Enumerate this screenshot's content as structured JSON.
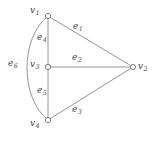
{
  "figure": {
    "type": "undirected-graph-diagram",
    "background_color": "#ffffff",
    "stroke_color": "#8a8a8a",
    "label_color": "#4a4a4a",
    "width": 155,
    "height": 142
  },
  "vertices": [
    {
      "id": "v1",
      "label": "v",
      "subscript": "1",
      "x": 48,
      "y": 16,
      "label_x": 30,
      "label_y": 6
    },
    {
      "id": "v2",
      "label": "v",
      "subscript": "2",
      "x": 133,
      "y": 67,
      "label_x": 138,
      "label_y": 62
    },
    {
      "id": "v3",
      "label": "v",
      "subscript": "3",
      "x": 48,
      "y": 67,
      "label_x": 30,
      "label_y": 60
    },
    {
      "id": "v4",
      "label": "v",
      "subscript": "4",
      "x": 48,
      "y": 120,
      "label_x": 30,
      "label_y": 119
    }
  ],
  "edges": [
    {
      "id": "e1",
      "label": "e",
      "subscript": "1",
      "from": "v1",
      "to": "v2",
      "shape": "straight",
      "label_x": 73,
      "label_y": 22
    },
    {
      "id": "e2",
      "label": "e",
      "subscript": "2",
      "from": "v3",
      "to": "v2",
      "shape": "straight",
      "label_x": 72,
      "label_y": 53
    },
    {
      "id": "e3",
      "label": "e",
      "subscript": "3",
      "from": "v4",
      "to": "v2",
      "shape": "straight",
      "label_x": 72,
      "label_y": 105
    },
    {
      "id": "e4",
      "label": "e",
      "subscript": "4",
      "from": "v1",
      "to": "v3",
      "shape": "straight",
      "label_x": 37,
      "label_y": 33
    },
    {
      "id": "e5",
      "label": "e",
      "subscript": "5",
      "from": "v3",
      "to": "v4",
      "shape": "straight",
      "label_x": 37,
      "label_y": 86
    },
    {
      "id": "e6",
      "label": "e",
      "subscript": "6",
      "from": "v1",
      "to": "v4",
      "shape": "curved-left",
      "label_x": 8,
      "label_y": 59
    }
  ]
}
